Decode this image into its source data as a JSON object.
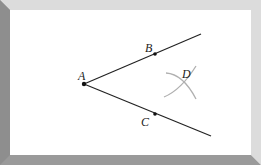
{
  "diagram": {
    "points": [
      {
        "id": "A",
        "label": "A",
        "x": 84,
        "y": 84
      },
      {
        "id": "B",
        "label": "B",
        "x": 155,
        "y": 54
      },
      {
        "id": "C",
        "label": "C",
        "x": 155,
        "y": 114
      },
      {
        "id": "D",
        "label": "D"
      }
    ],
    "rays": [
      {
        "from": "A",
        "through": "B"
      },
      {
        "from": "A",
        "through": "C"
      }
    ],
    "arcs": 2,
    "colors": {
      "frame_light": "#dcdcdc",
      "frame_dark": "#9a9a9a",
      "line": "#222222",
      "arc": "#b0b0b0"
    }
  }
}
